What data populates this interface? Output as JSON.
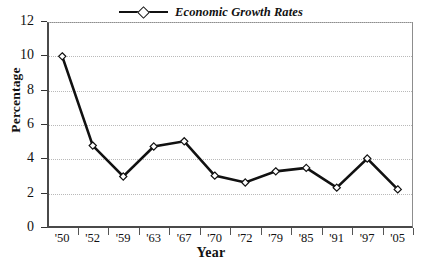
{
  "chart_data": {
    "type": "line",
    "title": "",
    "legend": [
      {
        "label": "Economic Growth Rates",
        "marker": "open-diamond",
        "color": "#111111"
      }
    ],
    "legend_position": "top-center",
    "categories": [
      "'50",
      "'52",
      "'59",
      "'63",
      "'67",
      "'70",
      "'72",
      "'79",
      "'85",
      "'91",
      "'97",
      "'05"
    ],
    "series": [
      {
        "name": "Economic Growth Rates",
        "values": [
          10.0,
          4.8,
          3.0,
          4.75,
          5.05,
          3.05,
          2.65,
          3.3,
          3.5,
          2.35,
          4.05,
          2.25
        ]
      }
    ],
    "xlabel": "Year",
    "ylabel": "Percentage",
    "ylim": [
      0,
      12
    ],
    "yticks": [
      0,
      2,
      4,
      6,
      8,
      10,
      12
    ],
    "ytick_labels": [
      "0",
      "2",
      "4",
      "6",
      "8",
      "10",
      "12"
    ],
    "grid": "horizontal-dotted",
    "grid_color": "#b9b9b9",
    "line_color": "#111111",
    "marker_fill": "#ffffff",
    "background": "#ffffff"
  }
}
